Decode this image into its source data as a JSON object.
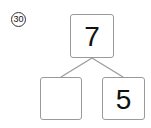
{
  "problem_number": "30",
  "tree": {
    "top": "7",
    "bottom_left": "",
    "bottom_right": "5"
  },
  "colors": {
    "box_border": "#9a9a9a",
    "line": "#9a9a9a",
    "text": "#111111"
  }
}
